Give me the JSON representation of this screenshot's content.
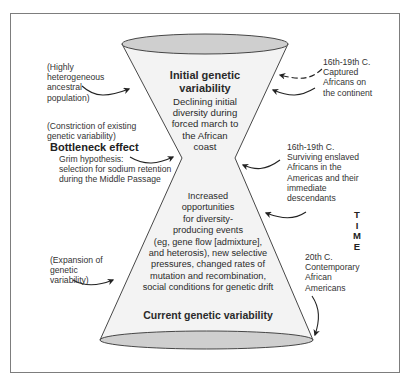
{
  "diagram": {
    "type": "hourglass",
    "colors": {
      "frame": "#7d7d7d",
      "ellipse_fill": "#cfcfcf",
      "body_fill": "#f3f3f3",
      "outline": "#333333",
      "text": "#2a2a2a"
    },
    "top": {
      "title_line1": "Initial genetic",
      "title_line2": "variability",
      "desc_lines": [
        "Declining initial",
        "diversity during",
        "forced march to",
        "the African",
        "coast"
      ]
    },
    "bottom": {
      "desc_lines": [
        "Increased",
        "opportunities",
        "for diversity-",
        "producing events",
        "(eg, gene flow [admixture],",
        "and heterosis), new selective",
        "pressures, changed rates of",
        "mutation and recombination,",
        "social conditions for genetic drift"
      ],
      "title": "Current genetic variability"
    },
    "left_labels": {
      "ancestral": [
        "(Highly",
        "heterogeneous",
        "ancestral",
        "population)"
      ],
      "constriction": [
        "(Constriction of existing",
        "genetic variability)"
      ],
      "bottleneck_title": "Bottleneck effect",
      "grim": [
        "Grim hypothesis:",
        "selection for sodium retention",
        "during the Middle Passage"
      ],
      "expansion": [
        "(Expansion of",
        "genetic",
        "variability)"
      ]
    },
    "right_labels": {
      "captured": [
        "16th-19th C.",
        "Captured",
        "Africans on",
        "the continent"
      ],
      "surviving": [
        "16th-19th C.",
        "Surviving enslaved",
        "Africans in the",
        "Americas and their",
        "immediate",
        "descendants"
      ],
      "contemporary": [
        "20th C.",
        "Contemporary",
        "African",
        "Americans"
      ]
    },
    "time_axis": [
      "T",
      "I",
      "M",
      "E"
    ]
  }
}
